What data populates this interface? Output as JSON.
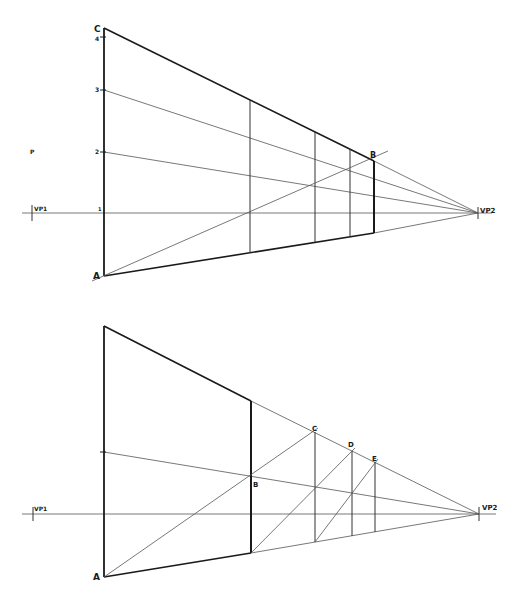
{
  "figure": {
    "type": "two-point perspective construction",
    "top_diagram": {
      "labels": {
        "corner_top": "C",
        "corner_bottom": "A",
        "point_b": "B",
        "vp_left": "VP1",
        "vp_right": "VP2",
        "tick_4": "4",
        "tick_3": "3",
        "tick_2": "2",
        "tick_1": "1"
      }
    },
    "bottom_diagram": {
      "labels": {
        "corner_bottom": "A",
        "point_b": "B",
        "point_c": "C",
        "point_d": "D",
        "point_e": "E",
        "vp_left": "VP1",
        "vp_right": "VP2"
      }
    },
    "stray_mark": "P"
  },
  "colors": {
    "ink": "#1a1a1a",
    "thin_line": "#555555",
    "background": "#ffffff"
  }
}
